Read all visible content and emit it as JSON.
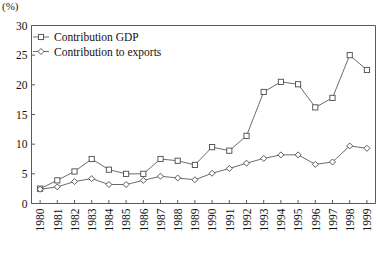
{
  "chart_data": {
    "type": "line",
    "title": "",
    "unit_label": "(%)",
    "xlabel": "",
    "ylabel": "",
    "ylim": [
      0,
      30
    ],
    "ytick_values": [
      0,
      5,
      10,
      15,
      20,
      25,
      30
    ],
    "ytick_labels": [
      "0",
      "5",
      "10",
      "15",
      "20",
      "25",
      "30"
    ],
    "grid": false,
    "legend_position": "top-left",
    "categories": [
      "1980",
      "1981",
      "1982",
      "1983",
      "1984",
      "1985",
      "1986",
      "1987",
      "1988",
      "1989",
      "1990",
      "1991",
      "1992",
      "1993",
      "1994",
      "1995",
      "1996",
      "1997",
      "1998",
      "1999"
    ],
    "series": [
      {
        "name": "Contribution GDP",
        "marker": "square",
        "values": [
          2.5,
          3.9,
          5.4,
          7.5,
          5.7,
          5.0,
          5.0,
          7.5,
          7.2,
          6.5,
          9.5,
          8.9,
          11.4,
          18.8,
          20.5,
          20.1,
          16.2,
          17.8,
          25.0,
          22.5
        ]
      },
      {
        "name": "Contribution to exports",
        "marker": "diamond",
        "values": [
          2.4,
          2.8,
          3.7,
          4.2,
          3.2,
          3.2,
          3.9,
          4.6,
          4.3,
          4.0,
          5.1,
          5.9,
          6.8,
          7.6,
          8.2,
          8.2,
          6.6,
          7.0,
          9.7,
          9.3
        ]
      }
    ]
  },
  "legend": {
    "items": [
      {
        "label": "Contribution GDP",
        "marker": "square"
      },
      {
        "label": "Contribution to exports",
        "marker": "diamond"
      }
    ]
  },
  "colors": {
    "axis": "#5a5a5a",
    "line": "#5b5b5b",
    "marker_fill": "#ffffff",
    "marker_stroke": "#4a4a4a",
    "text": "#111111",
    "background": "#ffffff"
  }
}
